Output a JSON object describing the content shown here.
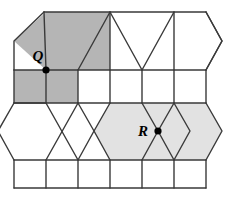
{
  "figure": {
    "background_color": "#ffffff",
    "stroke_color": "#3a3a3a",
    "stroke_width": 1.4,
    "width": 228,
    "height": 200
  },
  "palette": {
    "dark_shade": "#b5b5b5",
    "light_shade": "#e2e2e2",
    "unshaded": "#ffffff",
    "line": "#3a3a3a",
    "dot": "#000000",
    "label": "#000000"
  },
  "geometry": {
    "columns_x": [
      14,
      46,
      78,
      110,
      142,
      174,
      206
    ],
    "hex_bulge": 16,
    "rows_y": {
      "top_edge": 12,
      "upper_band_bottom": 70,
      "square_row_1_bottom": 103,
      "lower_band_bottom": 160,
      "square_row_2_bottom": 188
    },
    "left_edge": 14,
    "right_edge": 206,
    "hex_left_tip": -2,
    "hex_right_tip": 222
  },
  "shaded_regions": [
    {
      "name": "q-hexagon",
      "shade": "dark",
      "color": "#b5b5b5",
      "points": "14,41 46,12 110,12 110,70 46,70"
    },
    {
      "name": "q-square-left",
      "shade": "dark",
      "color": "#b5b5b5",
      "points": "14,70 46,70 46,103 14,103"
    },
    {
      "name": "q-square-right",
      "shade": "dark",
      "color": "#b5b5b5",
      "points": "46,70 78,70 78,103 46,103"
    },
    {
      "name": "r-hexagon-left",
      "shade": "light",
      "color": "#e2e2e2",
      "points": "110,103 174,103 190,131 174,160 110,160 94,131"
    },
    {
      "name": "r-hexagon-right",
      "shade": "light",
      "color": "#e2e2e2",
      "points": "174,103 206,103 222,131 206,160 174,160 190,131"
    }
  ],
  "vertices": [
    {
      "id": "Q",
      "label": "Q",
      "dot_x": 46,
      "dot_y": 70,
      "dot_radius": 3.6,
      "label_x": 38,
      "label_y": 61,
      "description": "Vertex where two triangles, a hexagon and two squares meet"
    },
    {
      "id": "R",
      "label": "R",
      "dot_x": 158,
      "dot_y": 131,
      "dot_radius": 3.6,
      "label_x": 143,
      "label_y": 136,
      "description": "Vertex where two hexagons and two triangles meet"
    }
  ],
  "edges": {
    "top_boundary": "44,12 206,12",
    "bottom_boundary": "14,188 206,188",
    "square_row_1": {
      "top_y": 70,
      "bottom_y": 103,
      "left_x": 14,
      "right_x": 206,
      "dividers_x": [
        46,
        78,
        110,
        142,
        174
      ]
    },
    "square_row_2": {
      "top_y": 160,
      "bottom_y": 188,
      "left_x": 14,
      "right_x": 206,
      "dividers_x": [
        46,
        78,
        110,
        142,
        174
      ]
    }
  },
  "counts": {
    "shaded_hexagons": 2,
    "marked_vertices": 2,
    "square_rows": 2,
    "hexagon_bands": 2
  }
}
